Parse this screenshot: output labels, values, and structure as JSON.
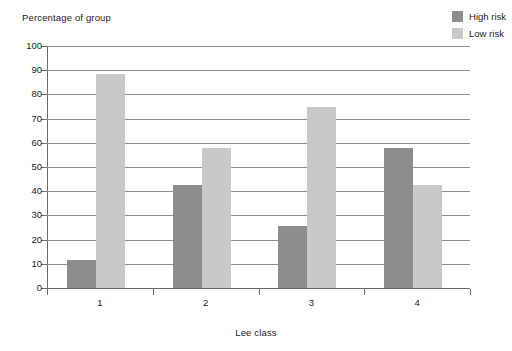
{
  "chart_data": {
    "type": "bar",
    "title": "",
    "xlabel": "Lee class",
    "ylabel": "Percentage of group",
    "categories": [
      "1",
      "2",
      "3",
      "4"
    ],
    "series": [
      {
        "name": "High risk",
        "color": "#8d8d8d",
        "values": [
          11.5,
          42.5,
          25.5,
          58
        ]
      },
      {
        "name": "Low risk",
        "color": "#c9c9c9",
        "values": [
          88.5,
          58,
          75,
          42.5
        ]
      }
    ],
    "ylim": [
      0,
      100
    ],
    "yticks": [
      0,
      10,
      20,
      30,
      40,
      50,
      60,
      70,
      80,
      90,
      100
    ],
    "ytick_labels": [
      "0",
      "10",
      "20",
      "30",
      "40",
      "50",
      "60",
      "70",
      "80",
      "90",
      "100"
    ],
    "grid": true,
    "grid_axis": "y",
    "legend_position": "top-right",
    "legend": [
      "High risk",
      "Low risk"
    ],
    "bar_group_style": "grouped"
  },
  "axes": {
    "y_title": "Percentage of group",
    "x_title": "Lee class"
  },
  "legend": {
    "entries": [
      {
        "label": "High risk",
        "color": "#8d8d8d"
      },
      {
        "label": "Low risk",
        "color": "#c9c9c9"
      }
    ]
  },
  "colors": {
    "high_risk": "#8d8d8d",
    "low_risk": "#c9c9c9",
    "gridline": "#8e8e8e",
    "axis": "#6a6a6a",
    "text": "#1a1a1a",
    "background": "#ffffff"
  }
}
